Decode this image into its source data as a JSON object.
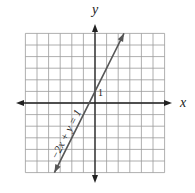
{
  "chart_data": {
    "type": "line",
    "title": "",
    "xlabel": "x",
    "ylabel": "y",
    "xlim": [
      -6,
      6
    ],
    "ylim": [
      -6,
      6
    ],
    "grid": true,
    "series": [
      {
        "name": "-2x + y = 1",
        "equation": "y = 2x + 1",
        "x": [
          -3.5,
          2.5
        ],
        "y": [
          -6,
          6
        ],
        "color": "#555555"
      }
    ],
    "annotations": [
      {
        "text": "1",
        "x": 0.2,
        "y": 1
      },
      {
        "text": "-2x + y = 1",
        "position": "along line, lower left",
        "rotation": -63
      }
    ]
  },
  "labels": {
    "x_axis": "x",
    "y_axis": "y",
    "intercept_tick": "1",
    "equation": "−2x + y = 1"
  },
  "colors": {
    "grid": "#9a9a9a",
    "axis": "#222222",
    "line": "#555555"
  }
}
